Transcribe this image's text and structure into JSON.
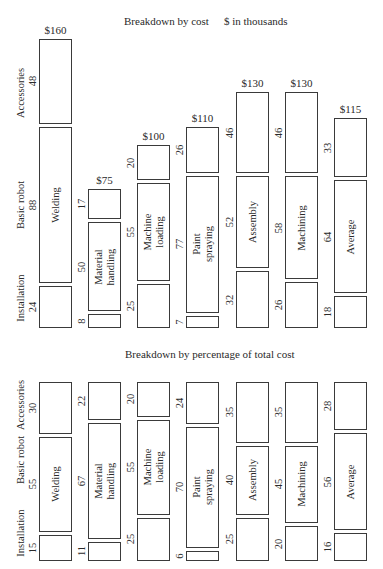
{
  "chart_data": [
    {
      "type": "bar",
      "stacked": true,
      "title": "Breakdown by cost",
      "subtitle": "$ in thousands",
      "categories": [
        "Welding",
        "Material handling",
        "Machine loading",
        "Paint spraying",
        "Assembly",
        "Machining",
        "Average"
      ],
      "series": [
        {
          "name": "Installation",
          "values": [
            24,
            8,
            25,
            7,
            32,
            26,
            18
          ]
        },
        {
          "name": "Basic robot",
          "values": [
            88,
            50,
            55,
            77,
            52,
            58,
            64
          ]
        },
        {
          "name": "Accessories",
          "values": [
            48,
            17,
            20,
            26,
            46,
            46,
            33
          ]
        }
      ],
      "totals": [
        "$160",
        "$75",
        "$100",
        "$110",
        "$130",
        "$130",
        "$115"
      ],
      "xlabel": "",
      "ylabel": "",
      "grid": false,
      "legend": "rotated labels on left side"
    },
    {
      "type": "bar",
      "stacked": true,
      "normalized": true,
      "title": "Breakdown by percentage of total cost",
      "categories": [
        "Welding",
        "Material handling",
        "Machine loading",
        "Paint spraying",
        "Assembly",
        "Machining",
        "Average"
      ],
      "series": [
        {
          "name": "Installation",
          "values": [
            15,
            11,
            25,
            6,
            25,
            20,
            16
          ]
        },
        {
          "name": "Basic robot",
          "values": [
            55,
            67,
            55,
            70,
            40,
            45,
            56
          ]
        },
        {
          "name": "Accessories",
          "values": [
            30,
            22,
            20,
            24,
            35,
            35,
            28
          ]
        }
      ],
      "ylim": [
        0,
        100
      ],
      "grid": false
    }
  ],
  "top": {
    "title": "Breakdown by cost",
    "subtitle": "$ in thousands",
    "legend": {
      "installation": "Installation",
      "basic": "Basic robot",
      "accessories": "Accessories"
    },
    "cols": [
      {
        "name": "Welding",
        "total": "$160",
        "inst": "24",
        "basic": "88",
        "acc": "48"
      },
      {
        "name": "Material\nhandling",
        "total": "$75",
        "inst": "8",
        "basic": "50",
        "acc": "17"
      },
      {
        "name": "Machine\nloading",
        "total": "$100",
        "inst": "25",
        "basic": "55",
        "acc": "20"
      },
      {
        "name": "Paint\nspraying",
        "total": "$110",
        "inst": "7",
        "basic": "77",
        "acc": "26"
      },
      {
        "name": "Assembly",
        "total": "$130",
        "inst": "32",
        "basic": "52",
        "acc": "46"
      },
      {
        "name": "Machining",
        "total": "$130",
        "inst": "26",
        "basic": "58",
        "acc": "46"
      },
      {
        "name": "Average",
        "total": "$115",
        "inst": "18",
        "basic": "64",
        "acc": "33"
      }
    ]
  },
  "bottom": {
    "title": "Breakdown by percentage of total cost",
    "legend": {
      "installation": "Installation",
      "basic": "Basic robot",
      "accessories": "Accessories"
    },
    "cols": [
      {
        "name": "Welding",
        "inst": "15",
        "basic": "55",
        "acc": "30"
      },
      {
        "name": "Material\nhandling",
        "inst": "11",
        "basic": "67",
        "acc": "22"
      },
      {
        "name": "Machine\nloading",
        "inst": "25",
        "basic": "55",
        "acc": "20"
      },
      {
        "name": "Paint\nspraying",
        "inst": "6",
        "basic": "70",
        "acc": "24"
      },
      {
        "name": "Assembly",
        "inst": "25",
        "basic": "40",
        "acc": "35"
      },
      {
        "name": "Machining",
        "inst": "20",
        "basic": "45",
        "acc": "35"
      },
      {
        "name": "Average",
        "inst": "16",
        "basic": "56",
        "acc": "28"
      }
    ]
  }
}
